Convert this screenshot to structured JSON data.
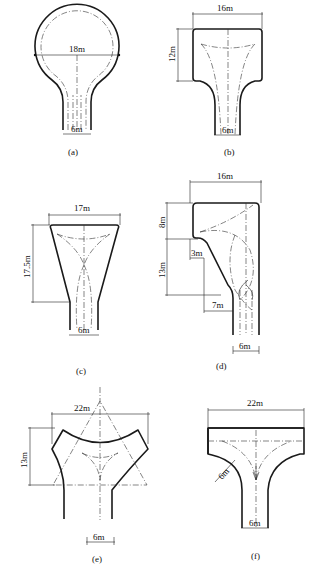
{
  "figure": {
    "panels": [
      {
        "id": "a",
        "caption": "(a)",
        "shape": "circular turnaround",
        "dimensions": {
          "diameter": "18m",
          "road_width": "6m"
        }
      },
      {
        "id": "b",
        "caption": "(b)",
        "shape": "rectangular turnaround",
        "dimensions": {
          "width": "16m",
          "depth": "12m",
          "road_width": "6m"
        }
      },
      {
        "id": "c",
        "caption": "(c)",
        "shape": "trapezoidal turnaround",
        "dimensions": {
          "width": "17m",
          "depth": "17.5m",
          "road_width": "6m"
        }
      },
      {
        "id": "d",
        "caption": "(d)",
        "shape": "side L-shaped turnaround",
        "dimensions": {
          "width": "16m",
          "upper_depth": "8m",
          "lower_depth": "13m",
          "offset_small": "3m",
          "offset_large": "7m",
          "road_width": "6m"
        }
      },
      {
        "id": "e",
        "caption": "(e)",
        "shape": "Y-shaped turnaround",
        "dimensions": {
          "width": "22m",
          "depth": "13m",
          "road_width": "6m"
        }
      },
      {
        "id": "f",
        "caption": "(f)",
        "shape": "T-shaped turnaround",
        "dimensions": {
          "width": "22m",
          "corner_radius": "6m",
          "road_width": "6m"
        }
      }
    ]
  },
  "labels": {
    "a_dia": "18m",
    "a_w": "6m",
    "a_cap": "(a)",
    "b_w": "16m",
    "b_h": "12m",
    "b_road": "6m",
    "b_cap": "(b)",
    "c_w": "17m",
    "c_h": "17.5m",
    "c_road": "6m",
    "c_cap": "(c)",
    "d_w": "16m",
    "d_h1": "8m",
    "d_h2": "13m",
    "d_3": "3m",
    "d_7": "7m",
    "d_road": "6m",
    "d_cap": "(d)",
    "e_w": "22m",
    "e_h": "13m",
    "e_road": "6m",
    "e_cap": "(e)",
    "f_w": "22m",
    "f_r": "6m",
    "f_road": "6m",
    "f_cap": "(f)"
  }
}
